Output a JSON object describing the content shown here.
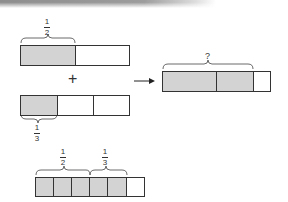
{
  "diagram": {
    "top_bar": {
      "label": {
        "numerator": "1",
        "denominator": "2"
      },
      "cells": [
        {
          "shaded": true
        },
        {
          "shaded": false
        }
      ]
    },
    "operator": "+",
    "middle_bar": {
      "label": {
        "numerator": "1",
        "denominator": "3"
      },
      "cells": [
        {
          "shaded": true
        },
        {
          "shaded": false
        },
        {
          "shaded": false
        }
      ]
    },
    "arrow": "→",
    "result_bar": {
      "label": "?",
      "cells": [
        {
          "shaded": true
        },
        {
          "shaded": true
        },
        {
          "shaded": false
        }
      ]
    },
    "bottom_bar": {
      "labels": [
        {
          "numerator": "1",
          "denominator": "2"
        },
        {
          "numerator": "1",
          "denominator": "3"
        }
      ],
      "cells": [
        {
          "shaded": true
        },
        {
          "shaded": true
        },
        {
          "shaded": true
        },
        {
          "shaded": true
        },
        {
          "shaded": true
        },
        {
          "shaded": false
        }
      ]
    },
    "colors": {
      "shaded": "#d3d3d3",
      "outline": "#333333",
      "background": "#ffffff"
    }
  }
}
